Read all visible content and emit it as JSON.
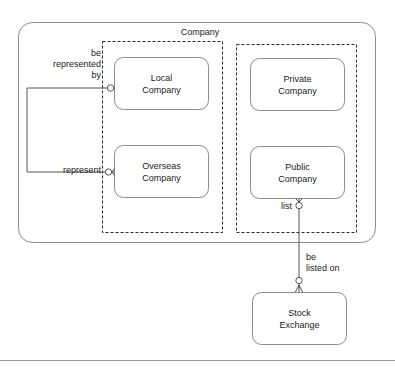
{
  "diagram": {
    "title": "Company",
    "type": "entity-relationship-diagram",
    "colors": {
      "entity_border": "#808080",
      "group_border": "#333333",
      "container_border": "#808080",
      "connector": "#555555",
      "text": "#1a1a1a",
      "background": "#ffffff",
      "rule": "#999999"
    },
    "container": {
      "name": "Company",
      "label": "Company"
    },
    "groups": [
      {
        "id": "group-left",
        "label": ""
      },
      {
        "id": "group-right",
        "label": ""
      }
    ],
    "entities": [
      {
        "id": "local-company",
        "line1": "Local",
        "line2": "Company"
      },
      {
        "id": "overseas-company",
        "line1": "Overseas",
        "line2": "Company"
      },
      {
        "id": "private-company",
        "line1": "Private",
        "line2": "Company"
      },
      {
        "id": "public-company",
        "line1": "Public",
        "line2": "Company"
      },
      {
        "id": "stock-exchange",
        "line1": "Stock",
        "line2": "Exchange"
      }
    ],
    "relationships": [
      {
        "id": "rel-be-represented-by",
        "line1": "be",
        "line2": "represented",
        "line3": "by",
        "from": "overseas-company",
        "to": "local-company",
        "source_cardinality": "zero-or-one",
        "target_cardinality": "zero-or-one"
      },
      {
        "id": "rel-represent",
        "line1": "represent",
        "from": "local-company",
        "to": "overseas-company",
        "source_cardinality": "zero-or-one",
        "target_cardinality": "zero-or-many"
      },
      {
        "id": "rel-list",
        "line1": "list",
        "from": "stock-exchange",
        "to": "public-company",
        "source_cardinality": "zero-or-many",
        "target_cardinality": "zero-or-many"
      },
      {
        "id": "rel-be-listed-on",
        "line1": "be",
        "line2": "listed on",
        "from": "public-company",
        "to": "stock-exchange",
        "source_cardinality": "zero-or-many",
        "target_cardinality": "zero-or-many"
      }
    ]
  }
}
